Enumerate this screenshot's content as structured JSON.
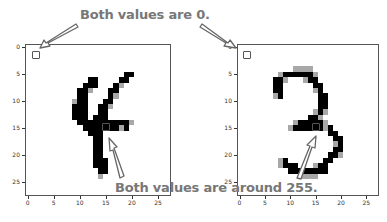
{
  "annotations": {
    "top": "Both values are 0.",
    "bottom": "Both values are around 255."
  },
  "plots": [
    {
      "name": "digit-four",
      "x_ticks": [
        "0",
        "5",
        "10",
        "15",
        "20",
        "25"
      ],
      "y_ticks": [
        "0",
        "5",
        "10",
        "15",
        "20",
        "25"
      ],
      "marked_pixels": [
        [
          1,
          1
        ],
        [
          15,
          15
        ]
      ]
    },
    {
      "name": "digit-three",
      "x_ticks": [
        "0",
        "5",
        "10",
        "15",
        "20",
        "25"
      ],
      "y_ticks": [
        "0",
        "5",
        "10",
        "15",
        "20",
        "25"
      ],
      "marked_pixels": [
        [
          1,
          1
        ],
        [
          15,
          15
        ]
      ]
    }
  ],
  "chart_data": [
    {
      "type": "heatmap",
      "title": "",
      "description": "28x28 grayscale MNIST digit '4' (inverted colormap: 255=black)",
      "xlabel": "",
      "ylabel": "",
      "xlim": [
        0,
        27
      ],
      "ylim": [
        27,
        0
      ],
      "x_ticks": [
        0,
        5,
        10,
        15,
        20,
        25
      ],
      "y_ticks": [
        0,
        5,
        10,
        15,
        20,
        25
      ],
      "highlighted": [
        {
          "x": 1,
          "y": 1,
          "value": 0
        },
        {
          "x": 15,
          "y": 15,
          "value": 255
        }
      ]
    },
    {
      "type": "heatmap",
      "title": "",
      "description": "28x28 grayscale MNIST digit '3' (inverted colormap: 255=black)",
      "xlabel": "",
      "ylabel": "",
      "xlim": [
        0,
        27
      ],
      "ylim": [
        27,
        0
      ],
      "x_ticks": [
        0,
        5,
        10,
        15,
        20,
        25
      ],
      "y_ticks": [
        0,
        5,
        10,
        15,
        20,
        25
      ],
      "highlighted": [
        {
          "x": 1,
          "y": 1,
          "value": 0
        },
        {
          "x": 15,
          "y": 15,
          "value": 255
        }
      ]
    }
  ],
  "images": {
    "four": [
      "............................",
      "............................",
      "............................",
      "............................",
      "............................",
      "...................##.......",
      "............##....##........",
      "...........###...#+.........",
      "..........##+...##..........",
      "..........##....#+..........",
      ".........+##...##...........",
      ".........###..##+...........",
      ".........###..##............",
      ".........###.###............",
      "..........##########+.......",
      "...........#######+#........",
      "............###.............",
      ".............##.............",
      ".............##.............",
      ".............##.............",
      ".............##.............",
      ".............###............",
      ".............###............",
      "..............##............",
      "..............+.............",
      "............................",
      "............................",
      "............................"
    ],
    "three": [
      "............................",
      "............................",
      "............................",
      "............................",
      "...........++++.............",
      "........+######+............",
      ".......##+...+##............",
      ".......##......##...........",
      ".......##......+#...........",
      ".......+#.......##..........",
      "................##..........",
      "................##..........",
      "...............+#+..........",
      "..............##+...........",
      "...........+#####+..........",
      "..........+######+#.........",
      "..................##........",
      "...................##.......",
      "...................+#.......",
      "...................##.......",
      "..................##+.......",
      "........+#.......##.........",
      "........+###...+##..........",
      "..........########..........",
      "............++++............",
      "............................",
      "............................",
      "............................"
    ]
  },
  "colors": {
    "ink": "#000000",
    "soft": "#a8a8a8",
    "paper": "#ffffff",
    "annotation": "#777777",
    "arrow": "#666666"
  }
}
